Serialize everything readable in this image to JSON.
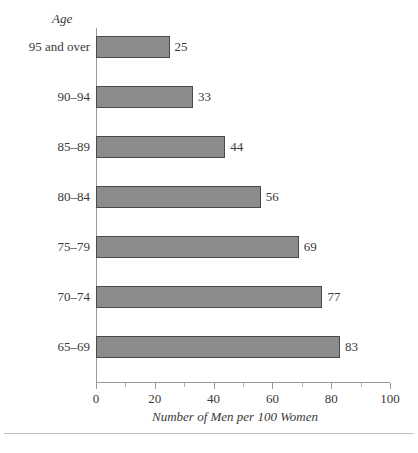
{
  "chart_data": {
    "type": "bar",
    "orientation": "horizontal",
    "title": "",
    "xlabel": "Number of Men per 100 Women",
    "ylabel": "Age",
    "categories": [
      "95 and over",
      "90–94",
      "85–89",
      "80–84",
      "75–79",
      "70–74",
      "65–69"
    ],
    "values": [
      25,
      33,
      44,
      56,
      69,
      77,
      83
    ],
    "data_labels": [
      "25",
      "33",
      "44",
      "56",
      "69",
      "77",
      "83"
    ],
    "xlim": [
      0,
      100
    ],
    "xticks": [
      0,
      20,
      40,
      60,
      80,
      100
    ],
    "xtick_labels": [
      "0",
      "20",
      "40",
      "60",
      "80",
      "100"
    ],
    "minor_tick_step": 10,
    "grid": false,
    "legend": null,
    "bar_fill_color": "#8c8c8c",
    "bar_border_color": "#4a4a4a",
    "axis_color": "#9a9a9a",
    "text_color": "#3a3a3a",
    "background_color": "#ffffff"
  }
}
